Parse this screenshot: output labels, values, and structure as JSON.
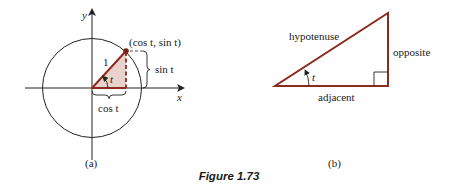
{
  "figure": {
    "caption": "Figure 1.73",
    "colors": {
      "triangle_stroke": "#8b2a1e",
      "triangle_fill": "#e9d2cb",
      "axis": "#222222",
      "text": "#1a1a1a"
    }
  },
  "panel_a": {
    "label": "(a)",
    "axis_x_label": "x",
    "axis_y_label": "y",
    "point_label": "(cos t, sin t)",
    "radius_label": "1",
    "angle_label": "t",
    "sin_label": "sin t",
    "cos_label": "cos t"
  },
  "panel_b": {
    "label": "(b)",
    "hypotenuse_label": "hypotenuse",
    "opposite_label": "opposite",
    "adjacent_label": "adjacent",
    "angle_label": "t"
  }
}
